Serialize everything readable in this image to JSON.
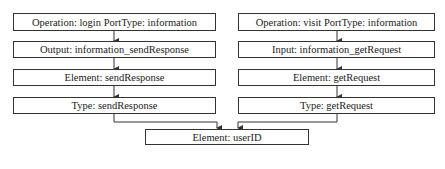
{
  "diagram": {
    "left_chain": [
      {
        "id": "op-login",
        "label": "Operation: login  PortType: information"
      },
      {
        "id": "output",
        "label": "Output: information_sendResponse"
      },
      {
        "id": "element-send",
        "label": "Element: sendResponse"
      },
      {
        "id": "type-send",
        "label": "Type: sendResponse"
      }
    ],
    "right_chain": [
      {
        "id": "op-visit",
        "label": "Operation: visit PortType: information"
      },
      {
        "id": "input",
        "label": "Input: information_getRequest"
      },
      {
        "id": "element-get",
        "label": "Element: getRequest"
      },
      {
        "id": "type-get",
        "label": "Type: getRequest"
      }
    ],
    "target": {
      "id": "element-userid",
      "label": "Element: userID"
    },
    "edges": [
      [
        "op-login",
        "output"
      ],
      [
        "output",
        "element-send"
      ],
      [
        "element-send",
        "type-send"
      ],
      [
        "op-visit",
        "input"
      ],
      [
        "input",
        "element-get"
      ],
      [
        "element-get",
        "type-get"
      ],
      [
        "type-send",
        "element-userid"
      ],
      [
        "type-get",
        "element-userid"
      ]
    ],
    "colors": {
      "line": "#333333",
      "background": "#ffffff"
    }
  }
}
